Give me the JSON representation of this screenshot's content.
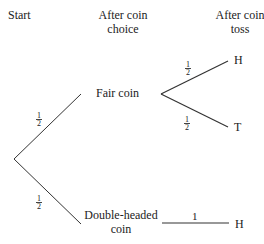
{
  "headers": {
    "start": "Start",
    "after_choice": [
      "After coin",
      "choice"
    ],
    "after_toss": [
      "After coin",
      "toss"
    ]
  },
  "nodes": {
    "fair": "Fair coin",
    "double": [
      "Double-headed",
      "coin"
    ],
    "fair_heads": "H",
    "fair_tails": "T",
    "double_heads": "H"
  },
  "probabilities": {
    "fair_branch": {
      "num": "1",
      "den": "2"
    },
    "double_branch": {
      "num": "1",
      "den": "2"
    },
    "fair_heads": {
      "num": "1",
      "den": "2"
    },
    "fair_tails": {
      "num": "1",
      "den": "2"
    },
    "double_heads": "1"
  },
  "colors": {
    "line": "#333333",
    "text": "#222222"
  }
}
